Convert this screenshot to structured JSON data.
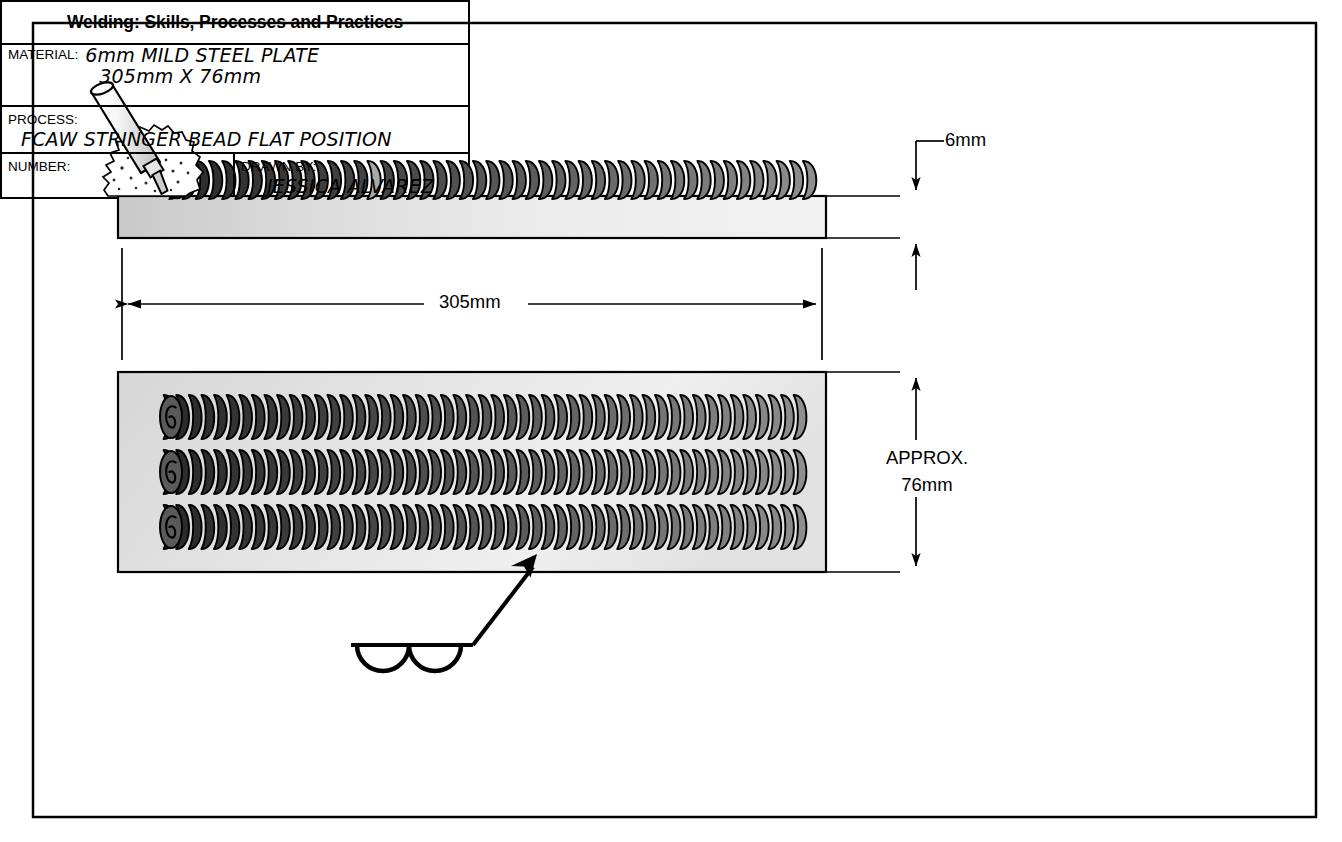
{
  "drawing": {
    "frame": {
      "name": "drawing-border"
    },
    "dimensions": {
      "thickness": "6mm",
      "length": "305mm",
      "width_label_line1": "APPROX.",
      "width_label_line2": "76mm"
    },
    "views": {
      "side_view": {
        "name": "side-elevation-view",
        "bead_count": 1
      },
      "plan_view": {
        "name": "plan-top-view",
        "bead_count": 3
      }
    },
    "torch": {
      "name": "fcaw-welding-gun",
      "parts": [
        "nozzle",
        "contact-tip",
        "spatter-cloud"
      ]
    },
    "weld_symbol": {
      "name": "bead-weld-symbol",
      "type": "bead-weld",
      "leader": "arrow-to-third-bead",
      "arcs": 2
    }
  },
  "title_block": {
    "title": "Welding: Skills, Processes and Practices",
    "material_label": "MATERIAL:",
    "material_value_line1": "6mm MILD STEEL PLATE",
    "material_value_line2": "305mm X 76mm",
    "process_label": "PROCESS:",
    "process_value": "FCAW STRINGER BEAD FLAT POSITION",
    "number_label": "NUMBER:",
    "number_value": "",
    "drawn_by_label": "DRAWN BY:",
    "drawn_by_value": "JESSICA ALVAREZ"
  },
  "colors": {
    "line": "#000000",
    "plate_fill_light": "#e9e9e9",
    "plate_fill_mid": "#d2d2d2",
    "bead_dark": "#2a2a2a",
    "bead_mid": "#5a5a5a",
    "bead_light": "#8e8e8e",
    "background": "#ffffff"
  }
}
